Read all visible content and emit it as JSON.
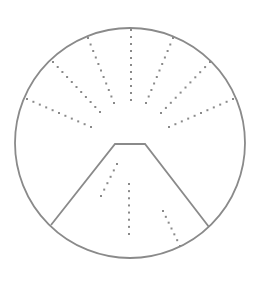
{
  "figure": {
    "width": 260,
    "height": 285,
    "background": "#ffffff",
    "stroke_color": "#8a8a8a",
    "dot_color": "#8a8a8a",
    "circle": {
      "cx": 130,
      "cy": 143,
      "r": 115,
      "stroke_width": 1.8
    },
    "trapezoid": {
      "points": [
        [
          51,
          225
        ],
        [
          115,
          144
        ],
        [
          145,
          144
        ],
        [
          209,
          227
        ]
      ],
      "stroke_width": 1.8
    },
    "dot_spacing": 7,
    "dot_size": 2,
    "upper_rays": [
      {
        "name": "ray-top-center",
        "from": [
          131,
          30
        ],
        "to": [
          131,
          100
        ]
      },
      {
        "name": "ray-upper-left",
        "from": [
          88,
          38
        ],
        "to": [
          114,
          103
        ]
      },
      {
        "name": "ray-upper-right",
        "from": [
          173,
          38
        ],
        "to": [
          146,
          103
        ]
      },
      {
        "name": "ray-middle-left",
        "from": [
          53,
          62
        ],
        "to": [
          100,
          112
        ]
      },
      {
        "name": "ray-middle-right",
        "from": [
          210,
          62
        ],
        "to": [
          161,
          113
        ]
      },
      {
        "name": "ray-lower-left",
        "from": [
          27,
          99
        ],
        "to": [
          91,
          127
        ]
      },
      {
        "name": "ray-lower-right",
        "from": [
          233,
          99
        ],
        "to": [
          169,
          127
        ]
      }
    ],
    "inner_rays": [
      {
        "name": "inner-ray-left",
        "from": [
          117,
          164
        ],
        "to": [
          101,
          196
        ]
      },
      {
        "name": "inner-ray-center",
        "from": [
          129,
          184
        ],
        "to": [
          129,
          234
        ]
      },
      {
        "name": "inner-ray-right",
        "from": [
          163,
          211
        ],
        "to": [
          180,
          246
        ]
      }
    ]
  }
}
